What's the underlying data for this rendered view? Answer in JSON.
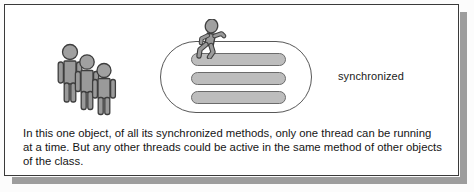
{
  "figure": {
    "background_color": "#ffffff",
    "border_color": "#3a3a3a",
    "shadow_color": "#9d9d9d"
  },
  "diagram": {
    "label": "synchronized",
    "object": {
      "name": "object",
      "shape": "stadium",
      "fill": "#ffffff",
      "stroke": "#585858",
      "methods": [
        {
          "name": "synchronized-method-1",
          "fill": "#bdbdbd",
          "stroke": "#6b6b6b"
        },
        {
          "name": "synchronized-method-2",
          "fill": "#bdbdbd",
          "stroke": "#6b6b6b"
        },
        {
          "name": "synchronized-method-3",
          "fill": "#bdbdbd",
          "stroke": "#6b6b6b"
        }
      ]
    },
    "running_thread": {
      "name": "running-thread-figure",
      "icon": "running-person-icon",
      "fill": "#9a9a9a",
      "stroke": "#3d3d3d",
      "count": 1
    },
    "waiting_threads": {
      "name": "waiting-threads-group",
      "icon": "standing-person-icon",
      "fill": "#9a9a9a",
      "stroke": "#3d3d3d",
      "count": 3
    }
  },
  "caption": {
    "text": "In this one object, of all its synchronized methods, only one thread can be running at a time. But any other threads could be active in the same method of other objects of the class."
  }
}
